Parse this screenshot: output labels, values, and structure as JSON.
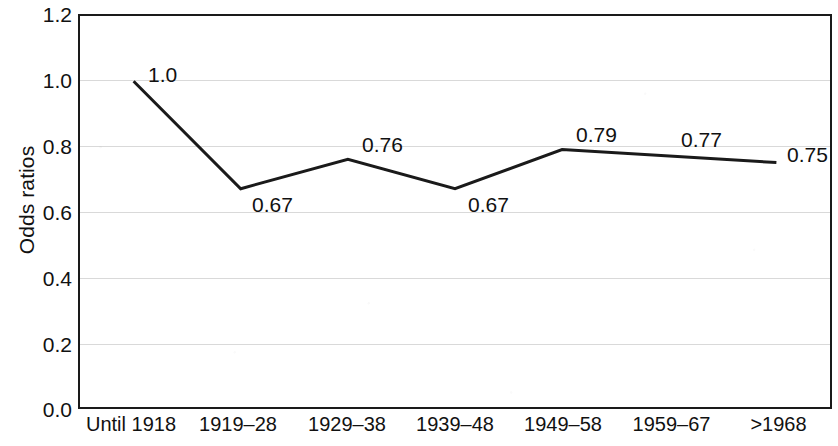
{
  "chart_data": {
    "type": "line",
    "title": "",
    "xlabel": "",
    "ylabel": "Odds ratios",
    "categories": [
      "Until 1918",
      "1919–28",
      "1929–38",
      "1939–48",
      "1949–58",
      "1959–67",
      ">1968"
    ],
    "values": [
      1.0,
      0.67,
      0.76,
      0.67,
      0.79,
      0.77,
      0.75
    ],
    "point_labels": [
      "1.0",
      "0.67",
      "0.76",
      "0.67",
      "0.79",
      "0.77",
      "0.75"
    ],
    "ylim": [
      0.0,
      1.2
    ],
    "ytick_values": [
      0.0,
      0.2,
      0.4,
      0.6,
      0.8,
      1.0,
      1.2
    ],
    "ytick_labels": [
      "0.0",
      "0.2",
      "0.4",
      "0.6",
      "0.8",
      "1.0",
      "1.2"
    ],
    "grid": true,
    "grid_color": "#d8d8d8",
    "legend": "none",
    "line_color": "#1a1a1a",
    "series": [
      {
        "name": "Odds ratios",
        "values": [
          1.0,
          0.67,
          0.76,
          0.67,
          0.79,
          0.77,
          0.75
        ]
      }
    ]
  },
  "axis": {
    "y_title": "Odds ratios",
    "y_labels": {
      "t0": "0.0",
      "t1": "0.2",
      "t2": "0.4",
      "t3": "0.6",
      "t4": "0.8",
      "t5": "1.0",
      "t6": "1.2"
    },
    "x_labels": {
      "c0": "Until 1918",
      "c1": "1919–28",
      "c2": "1929–38",
      "c3": "1939–48",
      "c4": "1949–58",
      "c5": "1959–67",
      "c6": ">1968"
    }
  },
  "point_labels": {
    "p0": "1.0",
    "p1": "0.67",
    "p2": "0.76",
    "p3": "0.67",
    "p4": "0.79",
    "p5": "0.77",
    "p6": "0.75"
  }
}
